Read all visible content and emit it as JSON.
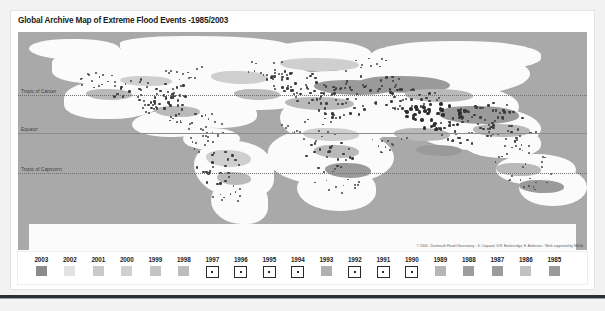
{
  "panel": {
    "title": "Global Archive Map of Extreme Flood Events -1985/2003"
  },
  "map": {
    "credit": "© 2004 - Dartmouth Flood Observatory - S. Caquard, G.R. Brakenridge, E. Anderson - Work supported by NASA",
    "lat_labels": [
      {
        "name": "tropic-of-cancer",
        "text": "Tropic of Cancer",
        "top_pct": 29.0,
        "style": "dotted"
      },
      {
        "name": "equator",
        "text": "Equator",
        "top_pct": 46.5,
        "style": "solid"
      },
      {
        "name": "tropic-of-capricorn",
        "text": "Tropic of Capricorn",
        "top_pct": 64.5,
        "style": "dotted"
      }
    ],
    "colors": {
      "ocean": "#a9a9a9",
      "land": "#fbfbfb",
      "flood_patch": "#b9b9b9",
      "flood_dot": "#3c3c3c"
    }
  },
  "legend": {
    "items": [
      {
        "year": "2003",
        "swatch": "solid",
        "color": "#8b8b8b"
      },
      {
        "year": "2002",
        "swatch": "solid",
        "color": "#e2e2e2"
      },
      {
        "year": "2001",
        "swatch": "solid",
        "color": "#c9c9c9"
      },
      {
        "year": "2000",
        "swatch": "solid",
        "color": "#d0d0d0"
      },
      {
        "year": "1999",
        "swatch": "solid",
        "color": "#c4c4c4"
      },
      {
        "year": "1998",
        "swatch": "solid",
        "color": "#bdbdbd"
      },
      {
        "year": "1997",
        "swatch": "marker",
        "color": "#ffffff"
      },
      {
        "year": "1996",
        "swatch": "marker",
        "color": "#ffffff"
      },
      {
        "year": "1995",
        "swatch": "marker",
        "color": "#ffffff"
      },
      {
        "year": "1994",
        "swatch": "marker",
        "color": "#ffffff"
      },
      {
        "year": "1993",
        "swatch": "solid",
        "color": "#b0b0b0"
      },
      {
        "year": "1992",
        "swatch": "marker",
        "color": "#ffffff"
      },
      {
        "year": "1991",
        "swatch": "marker",
        "color": "#ffffff"
      },
      {
        "year": "1990",
        "swatch": "marker",
        "color": "#ffffff"
      },
      {
        "year": "1989",
        "swatch": "solid",
        "color": "#b6b6b6"
      },
      {
        "year": "1988",
        "swatch": "solid",
        "color": "#9e9e9e"
      },
      {
        "year": "1987",
        "swatch": "solid",
        "color": "#9b9b9b"
      },
      {
        "year": "1986",
        "swatch": "solid",
        "color": "#c2c2c2"
      },
      {
        "year": "1985",
        "swatch": "solid",
        "color": "#9a9a9a"
      }
    ]
  },
  "map_shapes": {
    "land": [
      {
        "l": 2,
        "t": 3,
        "w": 16,
        "h": 10,
        "r": "48% 52% 40% 60%"
      },
      {
        "l": 18,
        "t": 2,
        "w": 30,
        "h": 9,
        "r": "40% 60% 50% 45%"
      },
      {
        "l": 6,
        "t": 8,
        "w": 24,
        "h": 16,
        "r": "45% 55% 60% 40%"
      },
      {
        "l": 22,
        "t": 6,
        "w": 26,
        "h": 18,
        "r": "55% 45% 40% 60%"
      },
      {
        "l": 44,
        "t": 4,
        "w": 18,
        "h": 12,
        "r": "50% 50% 45% 55%"
      },
      {
        "l": 30,
        "t": 14,
        "w": 24,
        "h": 22,
        "r": "40% 60% 55% 45%"
      },
      {
        "l": 15,
        "t": 16,
        "w": 22,
        "h": 20,
        "r": "55% 45% 50% 50%"
      },
      {
        "l": 8,
        "t": 22,
        "w": 18,
        "h": 18,
        "r": "50% 50% 60% 40%"
      },
      {
        "l": 26,
        "t": 30,
        "w": 16,
        "h": 14,
        "r": "45% 55% 40% 60%"
      },
      {
        "l": 20,
        "t": 36,
        "w": 14,
        "h": 12,
        "r": "60% 40% 50% 50%"
      },
      {
        "l": 29,
        "t": 44,
        "w": 10,
        "h": 10,
        "r": "50% 50% 50% 50%"
      },
      {
        "l": 31,
        "t": 50,
        "w": 14,
        "h": 26,
        "r": "45% 55% 35% 65%"
      },
      {
        "l": 34,
        "t": 68,
        "w": 10,
        "h": 20,
        "r": "50% 50% 40% 60%"
      },
      {
        "l": 46,
        "t": 28,
        "w": 20,
        "h": 24,
        "r": "50% 50% 45% 55%"
      },
      {
        "l": 44,
        "t": 44,
        "w": 22,
        "h": 26,
        "r": "45% 55% 50% 50%"
      },
      {
        "l": 49,
        "t": 62,
        "w": 14,
        "h": 20,
        "r": "50% 50% 45% 55%"
      },
      {
        "l": 44,
        "t": 18,
        "w": 22,
        "h": 16,
        "r": "55% 45% 50% 50%"
      },
      {
        "l": 56,
        "t": 8,
        "w": 34,
        "h": 22,
        "r": "45% 55% 50% 50%"
      },
      {
        "l": 62,
        "t": 4,
        "w": 30,
        "h": 14,
        "r": "50% 50% 45% 55%"
      },
      {
        "l": 62,
        "t": 24,
        "w": 26,
        "h": 22,
        "r": "50% 50% 55% 45%"
      },
      {
        "l": 70,
        "t": 34,
        "w": 22,
        "h": 20,
        "r": "45% 55% 50% 50%"
      },
      {
        "l": 78,
        "t": 44,
        "w": 14,
        "h": 14,
        "r": "50% 50% 45% 55%"
      },
      {
        "l": 84,
        "t": 56,
        "w": 14,
        "h": 14,
        "r": "50% 50% 50% 50%"
      },
      {
        "l": 88,
        "t": 62,
        "w": 12,
        "h": 18,
        "r": "45% 55% 50% 50%"
      },
      {
        "l": 58,
        "t": 32,
        "w": 14,
        "h": 16,
        "r": "55% 45% 45% 55%"
      },
      {
        "l": 2,
        "t": 88,
        "w": 96,
        "h": 12,
        "r": "0"
      }
    ],
    "patches": [
      {
        "l": 34,
        "t": 18,
        "w": 10,
        "h": 6,
        "c": "l"
      },
      {
        "l": 38,
        "t": 26,
        "w": 8,
        "h": 5,
        "c": ""
      },
      {
        "l": 47,
        "t": 30,
        "w": 12,
        "h": 6,
        "c": ""
      },
      {
        "l": 52,
        "t": 22,
        "w": 14,
        "h": 7,
        "c": "d"
      },
      {
        "l": 60,
        "t": 20,
        "w": 16,
        "h": 8,
        "c": "d"
      },
      {
        "l": 68,
        "t": 26,
        "w": 12,
        "h": 6,
        "c": ""
      },
      {
        "l": 74,
        "t": 34,
        "w": 14,
        "h": 8,
        "c": "d"
      },
      {
        "l": 80,
        "t": 42,
        "w": 10,
        "h": 6,
        "c": ""
      },
      {
        "l": 50,
        "t": 44,
        "w": 10,
        "h": 6,
        "c": "l"
      },
      {
        "l": 52,
        "t": 52,
        "w": 8,
        "h": 6,
        "c": ""
      },
      {
        "l": 54,
        "t": 60,
        "w": 8,
        "h": 7,
        "c": "d"
      },
      {
        "l": 33,
        "t": 54,
        "w": 8,
        "h": 8,
        "c": "l"
      },
      {
        "l": 35,
        "t": 64,
        "w": 6,
        "h": 6,
        "c": ""
      },
      {
        "l": 24,
        "t": 34,
        "w": 8,
        "h": 5,
        "c": ""
      },
      {
        "l": 46,
        "t": 12,
        "w": 14,
        "h": 6,
        "c": "l"
      },
      {
        "l": 84,
        "t": 60,
        "w": 8,
        "h": 6,
        "c": ""
      },
      {
        "l": 88,
        "t": 68,
        "w": 8,
        "h": 6,
        "c": "d"
      },
      {
        "l": 18,
        "t": 20,
        "w": 9,
        "h": 5,
        "c": "l"
      },
      {
        "l": 12,
        "t": 26,
        "w": 8,
        "h": 5,
        "c": ""
      },
      {
        "l": 66,
        "t": 44,
        "w": 10,
        "h": 6,
        "c": ""
      },
      {
        "l": 70,
        "t": 52,
        "w": 8,
        "h": 5,
        "c": "d"
      }
    ],
    "dot_clusters": [
      {
        "cx": 16,
        "cy": 22,
        "rx": 6,
        "ry": 5,
        "n": 18,
        "size": "sm"
      },
      {
        "cx": 23,
        "cy": 27,
        "rx": 7,
        "ry": 6,
        "n": 34,
        "size": ""
      },
      {
        "cx": 27,
        "cy": 33,
        "rx": 6,
        "ry": 6,
        "n": 30,
        "size": ""
      },
      {
        "cx": 31,
        "cy": 40,
        "rx": 5,
        "ry": 5,
        "n": 20,
        "size": "sm"
      },
      {
        "cx": 34,
        "cy": 50,
        "rx": 4,
        "ry": 6,
        "n": 16,
        "size": "sm"
      },
      {
        "cx": 35,
        "cy": 62,
        "rx": 4,
        "ry": 8,
        "n": 22,
        "size": ""
      },
      {
        "cx": 37,
        "cy": 76,
        "rx": 3,
        "ry": 6,
        "n": 10,
        "size": "sm"
      },
      {
        "cx": 48,
        "cy": 22,
        "rx": 5,
        "ry": 5,
        "n": 28,
        "size": ""
      },
      {
        "cx": 52,
        "cy": 28,
        "rx": 5,
        "ry": 5,
        "n": 26,
        "size": ""
      },
      {
        "cx": 56,
        "cy": 34,
        "rx": 5,
        "ry": 5,
        "n": 24,
        "size": ""
      },
      {
        "cx": 51,
        "cy": 44,
        "rx": 5,
        "ry": 6,
        "n": 18,
        "size": "sm"
      },
      {
        "cx": 55,
        "cy": 56,
        "rx": 5,
        "ry": 7,
        "n": 20,
        "size": ""
      },
      {
        "cx": 56,
        "cy": 68,
        "rx": 4,
        "ry": 6,
        "n": 14,
        "size": "sm"
      },
      {
        "cx": 62,
        "cy": 24,
        "rx": 6,
        "ry": 5,
        "n": 26,
        "size": ""
      },
      {
        "cx": 68,
        "cy": 30,
        "rx": 6,
        "ry": 6,
        "n": 34,
        "size": ""
      },
      {
        "cx": 73,
        "cy": 38,
        "rx": 6,
        "ry": 6,
        "n": 40,
        "size": "big"
      },
      {
        "cx": 78,
        "cy": 44,
        "rx": 6,
        "ry": 7,
        "n": 38,
        "size": ""
      },
      {
        "cx": 82,
        "cy": 36,
        "rx": 5,
        "ry": 5,
        "n": 26,
        "size": ""
      },
      {
        "cx": 86,
        "cy": 44,
        "rx": 5,
        "ry": 6,
        "n": 22,
        "size": ""
      },
      {
        "cx": 88,
        "cy": 56,
        "rx": 5,
        "ry": 6,
        "n": 16,
        "size": "sm"
      },
      {
        "cx": 90,
        "cy": 66,
        "rx": 5,
        "ry": 6,
        "n": 14,
        "size": "sm"
      },
      {
        "cx": 44,
        "cy": 16,
        "rx": 5,
        "ry": 4,
        "n": 12,
        "size": "sm"
      },
      {
        "cx": 60,
        "cy": 14,
        "rx": 6,
        "ry": 4,
        "n": 10,
        "size": "sm"
      },
      {
        "cx": 30,
        "cy": 18,
        "rx": 5,
        "ry": 4,
        "n": 12,
        "size": "sm"
      },
      {
        "cx": 64,
        "cy": 50,
        "rx": 5,
        "ry": 5,
        "n": 12,
        "size": "sm"
      }
    ]
  }
}
